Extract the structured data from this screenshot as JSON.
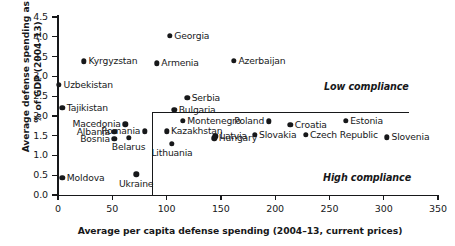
{
  "chart_data": {
    "type": "scatter",
    "title": "",
    "xlabel": "Average per capita defense spending (2004–13, current prices)",
    "ylabel": "Average defense spending as a % of GDP (2004–13)",
    "xlim": [
      0,
      350
    ],
    "ylim": [
      0.0,
      4.5
    ],
    "xticks": [
      "0",
      "50",
      "100",
      "150",
      "200",
      "250",
      "300",
      "350"
    ],
    "xtick_values": [
      0,
      50,
      100,
      150,
      200,
      250,
      300,
      350
    ],
    "yticks": [
      "0.0",
      "0.5",
      "1.0",
      "1.5",
      "2.0",
      "2.5",
      "3.0",
      "3.5",
      "4.0",
      "4.5"
    ],
    "ytick_values": [
      0.0,
      0.5,
      1.0,
      1.5,
      2.0,
      2.5,
      3.0,
      3.5,
      4.0,
      4.5
    ],
    "grid": false,
    "legend": "none",
    "marker_color": "#17181a",
    "annotations": [
      {
        "text": "Low compliance",
        "x": 245,
        "y": 2.87
      },
      {
        "text": "High compliance",
        "x": 244,
        "y": 0.58
      }
    ],
    "reference_lines": [
      {
        "orientation": "vertical",
        "x": 86,
        "y_from": 0.0,
        "y_to": 2.1
      },
      {
        "orientation": "horizontal",
        "y": 2.1,
        "x_from": 86,
        "x_to": 322
      }
    ],
    "points": [
      {
        "label": "Georgia",
        "x": 103,
        "y": 4.03,
        "label_side": "right"
      },
      {
        "label": "Kyrgyzstan",
        "x": 24,
        "y": 3.38,
        "label_side": "right"
      },
      {
        "label": "Armenia",
        "x": 91,
        "y": 3.33,
        "label_side": "right"
      },
      {
        "label": "Azerbaijan",
        "x": 162,
        "y": 3.4,
        "label_side": "right"
      },
      {
        "label": "Uzbekistan",
        "x": 1,
        "y": 2.78,
        "label_side": "right"
      },
      {
        "label": "Serbia",
        "x": 119,
        "y": 2.45,
        "label_side": "right"
      },
      {
        "label": "Tajikistan",
        "x": 4,
        "y": 2.21,
        "label_side": "right"
      },
      {
        "label": "Bulgaria",
        "x": 107,
        "y": 2.16,
        "label_side": "right"
      },
      {
        "label": "Macedonia",
        "x": 62,
        "y": 1.79,
        "label_side": "left"
      },
      {
        "label": "Montenegro",
        "x": 115,
        "y": 1.88,
        "label_side": "right"
      },
      {
        "label": "Poland",
        "x": 194,
        "y": 1.86,
        "label_side": "left"
      },
      {
        "label": "Estonia",
        "x": 265,
        "y": 1.88,
        "label_side": "right"
      },
      {
        "label": "Romania",
        "x": 80,
        "y": 1.61,
        "label_side": "left"
      },
      {
        "label": "Kazakhstan",
        "x": 100,
        "y": 1.61,
        "label_side": "right"
      },
      {
        "label": "Croatia",
        "x": 214,
        "y": 1.77,
        "label_side": "right"
      },
      {
        "label": "Albania",
        "x": 52,
        "y": 1.59,
        "label_side": "left"
      },
      {
        "label": "Latvia",
        "x": 145,
        "y": 1.48,
        "label_side": "right"
      },
      {
        "label": "Slovakia",
        "x": 181,
        "y": 1.52,
        "label_side": "right"
      },
      {
        "label": "Czech Republic",
        "x": 228,
        "y": 1.52,
        "label_side": "right"
      },
      {
        "label": "Slovenia",
        "x": 303,
        "y": 1.46,
        "label_side": "right"
      },
      {
        "label": "Bosnia",
        "x": 52,
        "y": 1.42,
        "label_side": "left"
      },
      {
        "label": "Belarus",
        "x": 65,
        "y": 1.45,
        "label_side": "bottom"
      },
      {
        "label": "Hungary",
        "x": 144,
        "y": 1.43,
        "label_side": "right"
      },
      {
        "label": "Lithuania",
        "x": 105,
        "y": 1.29,
        "label_side": "bottom"
      },
      {
        "label": "Moldova",
        "x": 4,
        "y": 0.44,
        "label_side": "right"
      },
      {
        "label": "Ukraine",
        "x": 72,
        "y": 0.52,
        "label_side": "bottom"
      }
    ]
  }
}
